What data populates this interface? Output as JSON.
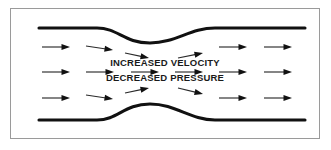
{
  "figure": {
    "type": "fluid-flow-diagram",
    "frame": {
      "border_color": "#9a9a9a",
      "background_color": "#ffffff",
      "x": 10,
      "y": 8,
      "width": 310,
      "height": 131
    },
    "colors": {
      "pipe_wall": "#111111",
      "arrow": "#1a1a1a",
      "text": "#1a1a1a",
      "background": "#ffffff"
    },
    "labels": [
      {
        "id": "increased-velocity",
        "text": "INCREASED VELOCITY",
        "x": 165,
        "y": 63
      },
      {
        "id": "decreased-pressure",
        "text": "DECREASED PRESSURE",
        "x": 165,
        "y": 78
      }
    ],
    "pipe": {
      "top_wall_path": "M 39,28 L 97,28 C 118,28 124,43 150,43 C 176,43 190,28 215,28 L 305,28",
      "bottom_wall_path": "M 39,120 L 97,120 C 118,120 124,104 150,104 C 176,104 190,120 215,120 L 305,120",
      "inlet_wall_y_top": 28,
      "inlet_wall_y_bottom": 120,
      "throat_y_top": 43,
      "throat_y_bottom": 104,
      "throat_center_x": 150
    },
    "streamlines": [
      {
        "id": "arrow-top-1",
        "x1": 42,
        "y1": 47,
        "x2": 70,
        "y2": 47
      },
      {
        "id": "arrow-top-2",
        "x1": 86,
        "y1": 46,
        "x2": 113,
        "y2": 50
      },
      {
        "id": "arrow-top-3",
        "x1": 125,
        "y1": 53,
        "x2": 149,
        "y2": 58
      },
      {
        "id": "arrow-top-4",
        "x1": 178,
        "y1": 58,
        "x2": 203,
        "y2": 53
      },
      {
        "id": "arrow-top-5",
        "x1": 219,
        "y1": 47,
        "x2": 247,
        "y2": 47
      },
      {
        "id": "arrow-top-6",
        "x1": 264,
        "y1": 47,
        "x2": 292,
        "y2": 47
      },
      {
        "id": "arrow-mid-1",
        "x1": 42,
        "y1": 72,
        "x2": 70,
        "y2": 72
      },
      {
        "id": "arrow-mid-2",
        "x1": 86,
        "y1": 72,
        "x2": 114,
        "y2": 72
      },
      {
        "id": "arrow-mid-3",
        "x1": 131,
        "y1": 72,
        "x2": 159,
        "y2": 72
      },
      {
        "id": "arrow-mid-4",
        "x1": 175,
        "y1": 72,
        "x2": 203,
        "y2": 72
      },
      {
        "id": "arrow-mid-5",
        "x1": 219,
        "y1": 72,
        "x2": 247,
        "y2": 72
      },
      {
        "id": "arrow-mid-6",
        "x1": 264,
        "y1": 72,
        "x2": 292,
        "y2": 72
      },
      {
        "id": "arrow-bot-1",
        "x1": 42,
        "y1": 98,
        "x2": 70,
        "y2": 98
      },
      {
        "id": "arrow-bot-2",
        "x1": 86,
        "y1": 95,
        "x2": 113,
        "y2": 99
      },
      {
        "id": "arrow-bot-3",
        "x1": 125,
        "y1": 93,
        "x2": 149,
        "y2": 88
      },
      {
        "id": "arrow-bot-4",
        "x1": 178,
        "y1": 88,
        "x2": 203,
        "y2": 94
      },
      {
        "id": "arrow-bot-5",
        "x1": 219,
        "y1": 98,
        "x2": 247,
        "y2": 98
      },
      {
        "id": "arrow-bot-6",
        "x1": 264,
        "y1": 98,
        "x2": 292,
        "y2": 98
      }
    ]
  }
}
